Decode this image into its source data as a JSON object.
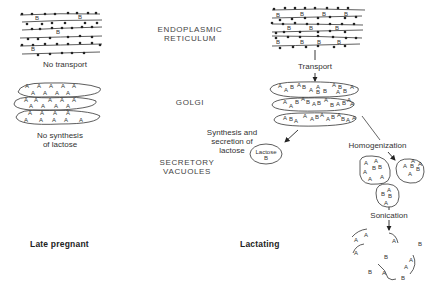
{
  "labels": {
    "endoplasmic_reticulum": "ENDOPLASMIC\nRETICULUM",
    "golgi": "GOLGI",
    "secretory_vacuoles": "SECRETORY\nVACUOLES",
    "no_transport": "No transport",
    "transport": "Transport",
    "no_synthesis": "No synthesis\nof lactose",
    "synthesis_secretion": "Synthesis and\nsecretion of\nlactose",
    "lactose_vacuole": "Lactose\nB",
    "homogenization": "Homogenization",
    "sonication": "Sonication"
  },
  "stages": {
    "left": "Late pregnant",
    "right": "Lactating"
  },
  "markers": {
    "enzyme_a": "A",
    "enzyme_b": "B"
  },
  "colors": {
    "ink": "#222222",
    "background": "#ffffff"
  }
}
